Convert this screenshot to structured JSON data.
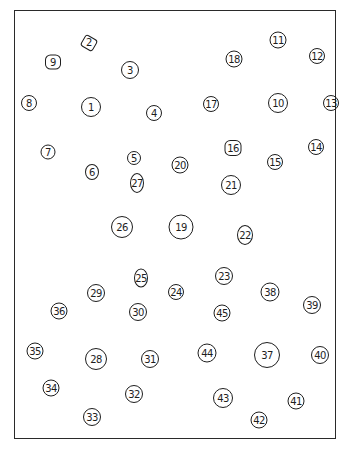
{
  "diagram": {
    "type": "numbered node layout",
    "frame": {
      "color": "#2a2a2a"
    },
    "nodes": [
      {
        "id": "1",
        "label": "1",
        "x": 91,
        "y": 107,
        "w": 20,
        "h": 20,
        "shape": "circle"
      },
      {
        "id": "2",
        "label": "2",
        "x": 89,
        "y": 43,
        "w": 14,
        "h": 13,
        "shape": "diamond"
      },
      {
        "id": "3",
        "label": "3",
        "x": 130,
        "y": 70,
        "w": 18,
        "h": 18,
        "shape": "circle"
      },
      {
        "id": "4",
        "label": "4",
        "x": 154,
        "y": 113,
        "w": 16,
        "h": 16,
        "shape": "circle"
      },
      {
        "id": "5",
        "label": "5",
        "x": 134,
        "y": 158,
        "w": 14,
        "h": 14,
        "shape": "circle"
      },
      {
        "id": "6",
        "label": "6",
        "x": 92,
        "y": 172,
        "w": 14,
        "h": 16,
        "shape": "oval"
      },
      {
        "id": "7",
        "label": "7",
        "x": 48,
        "y": 152,
        "w": 15,
        "h": 15,
        "shape": "circle"
      },
      {
        "id": "8",
        "label": "8",
        "x": 29,
        "y": 103,
        "w": 16,
        "h": 16,
        "shape": "circle"
      },
      {
        "id": "9",
        "label": "9",
        "x": 53,
        "y": 62,
        "w": 16,
        "h": 15,
        "shape": "hex"
      },
      {
        "id": "10",
        "label": "10",
        "x": 278,
        "y": 103,
        "w": 20,
        "h": 20,
        "shape": "oval"
      },
      {
        "id": "11",
        "label": "11",
        "x": 278,
        "y": 40,
        "w": 17,
        "h": 17,
        "shape": "circle"
      },
      {
        "id": "12",
        "label": "12",
        "x": 317,
        "y": 56,
        "w": 16,
        "h": 16,
        "shape": "circle"
      },
      {
        "id": "13",
        "label": "13",
        "x": 331,
        "y": 103,
        "w": 16,
        "h": 16,
        "shape": "circle"
      },
      {
        "id": "14",
        "label": "14",
        "x": 316,
        "y": 147,
        "w": 16,
        "h": 16,
        "shape": "circle"
      },
      {
        "id": "15",
        "label": "15",
        "x": 275,
        "y": 162,
        "w": 16,
        "h": 16,
        "shape": "circle"
      },
      {
        "id": "16",
        "label": "16",
        "x": 233,
        "y": 148,
        "w": 17,
        "h": 16,
        "shape": "hex"
      },
      {
        "id": "17",
        "label": "17",
        "x": 211,
        "y": 104,
        "w": 16,
        "h": 16,
        "shape": "circle"
      },
      {
        "id": "18",
        "label": "18",
        "x": 234,
        "y": 59,
        "w": 17,
        "h": 17,
        "shape": "circle"
      },
      {
        "id": "19",
        "label": "19",
        "x": 181,
        "y": 227,
        "w": 25,
        "h": 25,
        "shape": "circle"
      },
      {
        "id": "20",
        "label": "20",
        "x": 180,
        "y": 165,
        "w": 17,
        "h": 17,
        "shape": "circle"
      },
      {
        "id": "21",
        "label": "21",
        "x": 231,
        "y": 185,
        "w": 20,
        "h": 20,
        "shape": "circle"
      },
      {
        "id": "22",
        "label": "22",
        "x": 245,
        "y": 235,
        "w": 16,
        "h": 20,
        "shape": "oval"
      },
      {
        "id": "23",
        "label": "23",
        "x": 224,
        "y": 276,
        "w": 18,
        "h": 18,
        "shape": "circle"
      },
      {
        "id": "24",
        "label": "24",
        "x": 176,
        "y": 292,
        "w": 16,
        "h": 16,
        "shape": "circle"
      },
      {
        "id": "25",
        "label": "25",
        "x": 141,
        "y": 278,
        "w": 14,
        "h": 19,
        "shape": "oval"
      },
      {
        "id": "26",
        "label": "26",
        "x": 122,
        "y": 227,
        "w": 22,
        "h": 22,
        "shape": "circle"
      },
      {
        "id": "27",
        "label": "27",
        "x": 137,
        "y": 183,
        "w": 14,
        "h": 20,
        "shape": "oval"
      },
      {
        "id": "28",
        "label": "28",
        "x": 96,
        "y": 359,
        "w": 22,
        "h": 22,
        "shape": "circle"
      },
      {
        "id": "29",
        "label": "29",
        "x": 96,
        "y": 293,
        "w": 18,
        "h": 18,
        "shape": "circle"
      },
      {
        "id": "30",
        "label": "30",
        "x": 138,
        "y": 312,
        "w": 18,
        "h": 18,
        "shape": "circle"
      },
      {
        "id": "31",
        "label": "31",
        "x": 150,
        "y": 359,
        "w": 18,
        "h": 18,
        "shape": "circle"
      },
      {
        "id": "32",
        "label": "32",
        "x": 134,
        "y": 394,
        "w": 18,
        "h": 18,
        "shape": "circle"
      },
      {
        "id": "33",
        "label": "33",
        "x": 92,
        "y": 417,
        "w": 18,
        "h": 18,
        "shape": "circle"
      },
      {
        "id": "34",
        "label": "34",
        "x": 51,
        "y": 388,
        "w": 17,
        "h": 17,
        "shape": "circle"
      },
      {
        "id": "35",
        "label": "35",
        "x": 35,
        "y": 351,
        "w": 17,
        "h": 17,
        "shape": "circle"
      },
      {
        "id": "36",
        "label": "36",
        "x": 59,
        "y": 311,
        "w": 17,
        "h": 17,
        "shape": "circle"
      },
      {
        "id": "37",
        "label": "37",
        "x": 267,
        "y": 355,
        "w": 26,
        "h": 26,
        "shape": "circle"
      },
      {
        "id": "38",
        "label": "38",
        "x": 270,
        "y": 292,
        "w": 19,
        "h": 19,
        "shape": "circle"
      },
      {
        "id": "39",
        "label": "39",
        "x": 312,
        "y": 305,
        "w": 18,
        "h": 18,
        "shape": "circle"
      },
      {
        "id": "40",
        "label": "40",
        "x": 320,
        "y": 355,
        "w": 18,
        "h": 18,
        "shape": "circle"
      },
      {
        "id": "41",
        "label": "41",
        "x": 296,
        "y": 401,
        "w": 17,
        "h": 17,
        "shape": "circle"
      },
      {
        "id": "42",
        "label": "42",
        "x": 259,
        "y": 420,
        "w": 17,
        "h": 17,
        "shape": "circle"
      },
      {
        "id": "43",
        "label": "43",
        "x": 223,
        "y": 398,
        "w": 20,
        "h": 20,
        "shape": "circle"
      },
      {
        "id": "44",
        "label": "44",
        "x": 207,
        "y": 353,
        "w": 19,
        "h": 19,
        "shape": "circle"
      },
      {
        "id": "45",
        "label": "45",
        "x": 222,
        "y": 313,
        "w": 17,
        "h": 17,
        "shape": "circle"
      }
    ]
  }
}
